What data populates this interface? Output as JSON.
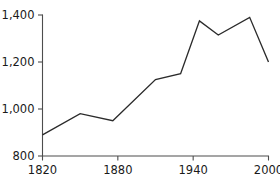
{
  "chart_data": {
    "type": "line",
    "title": "",
    "subtitle": "",
    "xlabel": "",
    "ylabel": "",
    "xlim": [
      1820,
      2000
    ],
    "ylim": [
      800,
      1400
    ],
    "grid": false,
    "legend": null,
    "x_ticks": [
      1820,
      1880,
      1940,
      2000
    ],
    "x_tick_labels": [
      "1820",
      "1880",
      "1940",
      "2000"
    ],
    "y_ticks": [
      800,
      1000,
      1200,
      1400
    ],
    "y_tick_labels": [
      "800",
      "1,000",
      "1,200",
      "1,400"
    ],
    "series": [
      {
        "name": "",
        "color": "#2b2b2b",
        "x": [
          1820,
          1850,
          1876,
          1910,
          1930,
          1945,
          1960,
          1985,
          2000
        ],
        "y": [
          890,
          980,
          950,
          1125,
          1150,
          1375,
          1315,
          1390,
          1200
        ],
        "points": [
          {
            "x": 1820,
            "y": 890
          },
          {
            "x": 1850,
            "y": 980
          },
          {
            "x": 1876,
            "y": 950
          },
          {
            "x": 1910,
            "y": 1125
          },
          {
            "x": 1930,
            "y": 1150
          },
          {
            "x": 1945,
            "y": 1375
          },
          {
            "x": 1960,
            "y": 1315
          },
          {
            "x": 1985,
            "y": 1390
          },
          {
            "x": 2000,
            "y": 1200
          }
        ]
      }
    ],
    "axis_color": "#4d4d4d",
    "text_color": "#1a1a1a",
    "background": "#ffffff"
  }
}
